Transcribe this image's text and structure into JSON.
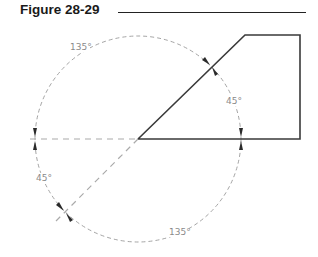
{
  "figure": {
    "title": "Figure 28-29"
  },
  "diagram": {
    "labels": {
      "top_arc": "135°",
      "right_arc": "45°",
      "left_arc": "45°",
      "bottom_arc": "135°"
    },
    "colors": {
      "object_line": "#3a3a3a",
      "dim_line": "#9a9a9a",
      "arrow": "#2a2a2a"
    }
  }
}
